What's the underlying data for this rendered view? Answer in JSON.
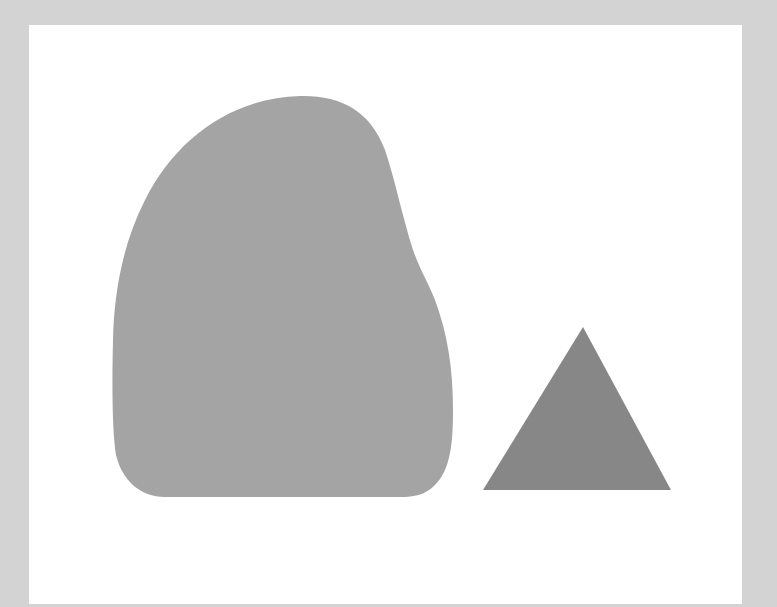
{
  "scene": {
    "background_color": "#d3d3d3",
    "canvas_color": "#ffffff",
    "shapes": [
      {
        "name": "rounded-blob",
        "kind": "blob",
        "fill": "#a4a4a4"
      },
      {
        "name": "triangle",
        "kind": "triangle",
        "fill": "#878787"
      }
    ]
  }
}
